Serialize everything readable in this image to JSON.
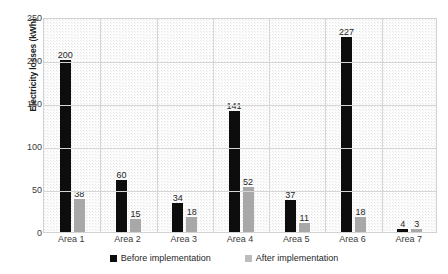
{
  "chart_data": {
    "type": "bar",
    "title": "",
    "xlabel": "",
    "ylabel": "Electricity losses (kWh)",
    "ylim": [
      0,
      250
    ],
    "yticks": [
      0,
      50,
      100,
      150,
      200,
      250
    ],
    "ytick_labels": [
      "0",
      "50",
      "100",
      "150",
      "200",
      "250"
    ],
    "grid": "horizontal-and-vertical",
    "legend_position": "bottom-center",
    "categories": [
      "Area 1",
      "Area 2",
      "Area 3",
      "Area 4",
      "Area 5",
      "Area 6",
      "Area 7"
    ],
    "series": [
      {
        "name": "Before implementation",
        "color": "#0d0d0d",
        "values": [
          200,
          60,
          34,
          141,
          37,
          227,
          4
        ],
        "value_labels": [
          "200",
          "60",
          "34",
          "141",
          "37",
          "227",
          "4"
        ]
      },
      {
        "name": "After implementation",
        "color": "#a8a8a8",
        "values": [
          38,
          15,
          18,
          52,
          11,
          18,
          3
        ],
        "value_labels": [
          "38",
          "15",
          "18",
          "52",
          "11",
          "18",
          "3"
        ]
      }
    ]
  },
  "legend": {
    "items": [
      {
        "label": "Before implementation",
        "swatch": "black-square-icon"
      },
      {
        "label": "After implementation",
        "swatch": "gray-square-icon"
      }
    ]
  }
}
